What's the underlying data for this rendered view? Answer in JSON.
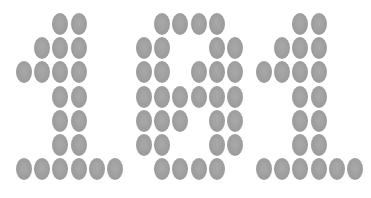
{
  "display": {
    "text": "101",
    "dot_color": "#9e9e9e",
    "background": "#ffffff",
    "digits": [
      {
        "char": "1",
        "x_offset": 6,
        "rows": [
          "001100",
          "011100",
          "111100",
          "001100",
          "001100",
          "001100",
          "111111"
        ]
      },
      {
        "char": "0",
        "x_offset": 126,
        "rows": [
          "011110",
          "110011",
          "110111",
          "111111",
          "111011",
          "110011",
          "011110"
        ]
      },
      {
        "char": "1",
        "x_offset": 246,
        "rows": [
          "001100",
          "011100",
          "111100",
          "001100",
          "001100",
          "001100",
          "111111"
        ]
      }
    ],
    "grid": {
      "col_pitch": 18.2,
      "row_pitch": 24.2,
      "first_col_x": 18,
      "first_row_y": 24
    }
  }
}
